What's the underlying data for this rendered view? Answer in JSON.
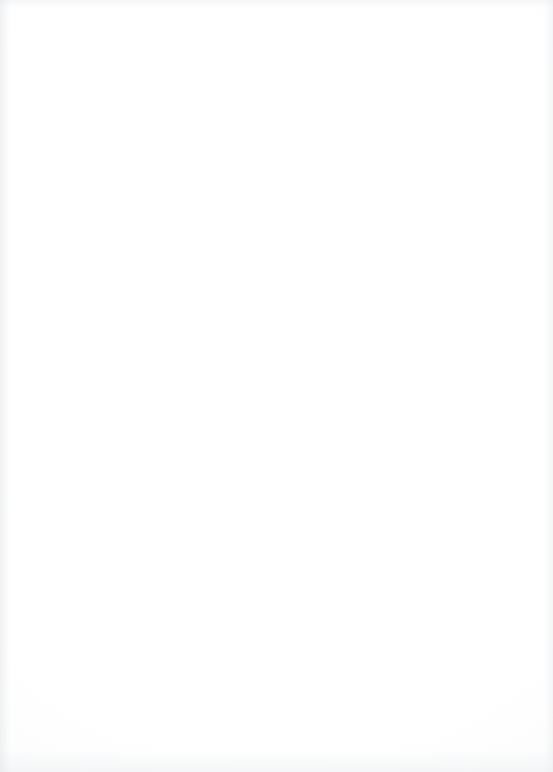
{
  "page": {
    "type": "lined-notebook-page",
    "width": 553,
    "height": 772,
    "background_color": "#fdfdfc",
    "rule_color": "#c5c9cd",
    "ink_color": "#1a1a1a"
  },
  "prompt": {
    "line_1": "TAKE A WALK ON YOUR LUNCH BREAK.",
    "line_2": "LIST EVERYTHING YOU HEAR, SEE, OR THINK.",
    "underline": "thick-hand-drawn-underline"
  },
  "ruled_lines": {
    "count": 31,
    "first_y": 16,
    "spacing": 23.7,
    "left_x": 4,
    "right_x": 546,
    "blank_writing_lines": 28
  }
}
